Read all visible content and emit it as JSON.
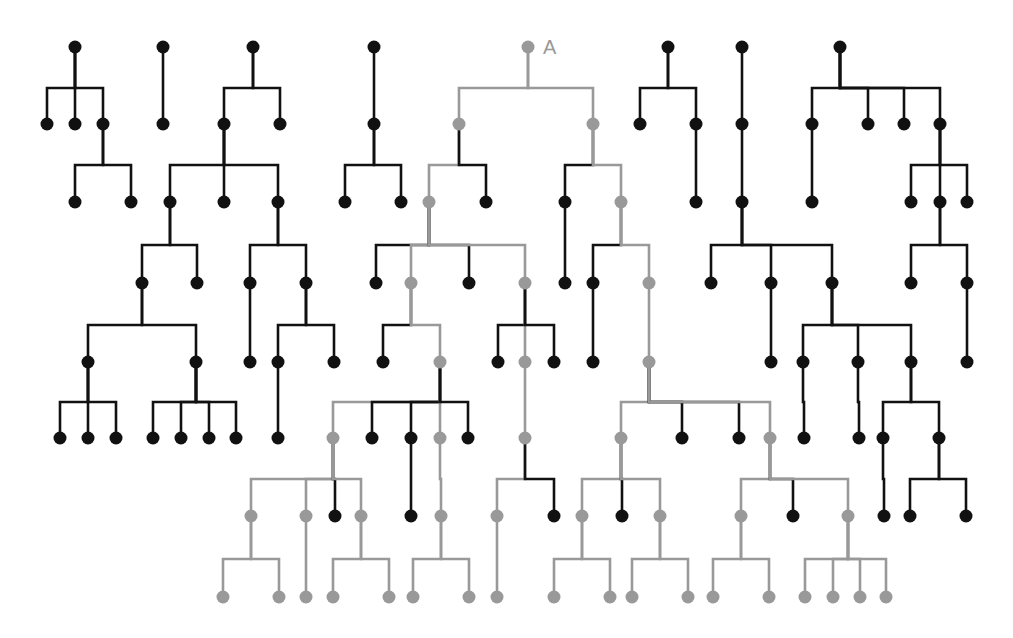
{
  "diagram": {
    "title": "",
    "label_A": "A",
    "colors": {
      "black": "#111111",
      "gray": "#999999",
      "background": "#ffffff"
    },
    "row_y": [
      47,
      124,
      202,
      283,
      362,
      438,
      516,
      597
    ],
    "nodes": [
      {
        "id": "t1",
        "x": 75,
        "y": 47,
        "c": "b"
      },
      {
        "id": "t1a",
        "x": 47,
        "y": 124,
        "c": "b"
      },
      {
        "id": "t1b",
        "x": 75,
        "y": 124,
        "c": "b"
      },
      {
        "id": "t1c",
        "x": 103,
        "y": 124,
        "c": "b"
      },
      {
        "id": "t1c1",
        "x": 75,
        "y": 202,
        "c": "b"
      },
      {
        "id": "t1c2",
        "x": 131,
        "y": 202,
        "c": "b"
      },
      {
        "id": "t2",
        "x": 163,
        "y": 47,
        "c": "b"
      },
      {
        "id": "t2a",
        "x": 163,
        "y": 124,
        "c": "b"
      },
      {
        "id": "t3",
        "x": 253,
        "y": 47,
        "c": "b"
      },
      {
        "id": "t3a",
        "x": 224,
        "y": 124,
        "c": "b"
      },
      {
        "id": "t3b",
        "x": 280,
        "y": 124,
        "c": "b"
      },
      {
        "id": "t3a1",
        "x": 170,
        "y": 202,
        "c": "b"
      },
      {
        "id": "t3a2",
        "x": 224,
        "y": 202,
        "c": "b"
      },
      {
        "id": "t3a3",
        "x": 278,
        "y": 202,
        "c": "b"
      },
      {
        "id": "t3a1a",
        "x": 142,
        "y": 283,
        "c": "b"
      },
      {
        "id": "t3a1b",
        "x": 197,
        "y": 283,
        "c": "b"
      },
      {
        "id": "t3a3a",
        "x": 250,
        "y": 283,
        "c": "b"
      },
      {
        "id": "t3a3b",
        "x": 306,
        "y": 283,
        "c": "b"
      },
      {
        "id": "t3x1",
        "x": 88,
        "y": 362,
        "c": "b"
      },
      {
        "id": "t3x2",
        "x": 196,
        "y": 362,
        "c": "b"
      },
      {
        "id": "t3a3a1",
        "x": 250,
        "y": 362,
        "c": "b"
      },
      {
        "id": "t3a3b1",
        "x": 278,
        "y": 362,
        "c": "b"
      },
      {
        "id": "t3a3b2",
        "x": 334,
        "y": 362,
        "c": "b"
      },
      {
        "id": "l1",
        "x": 60,
        "y": 438,
        "c": "b"
      },
      {
        "id": "l2",
        "x": 88,
        "y": 438,
        "c": "b"
      },
      {
        "id": "l3",
        "x": 116,
        "y": 438,
        "c": "b"
      },
      {
        "id": "l4",
        "x": 153,
        "y": 438,
        "c": "b"
      },
      {
        "id": "l5",
        "x": 181,
        "y": 438,
        "c": "b"
      },
      {
        "id": "l6",
        "x": 209,
        "y": 438,
        "c": "b"
      },
      {
        "id": "l7",
        "x": 236,
        "y": 438,
        "c": "b"
      },
      {
        "id": "l8",
        "x": 278,
        "y": 438,
        "c": "b"
      },
      {
        "id": "t4",
        "x": 374,
        "y": 47,
        "c": "b"
      },
      {
        "id": "t4a",
        "x": 374,
        "y": 124,
        "c": "b"
      },
      {
        "id": "t4a1",
        "x": 345,
        "y": 202,
        "c": "b"
      },
      {
        "id": "t4a2",
        "x": 401,
        "y": 202,
        "c": "b"
      },
      {
        "id": "A",
        "x": 528,
        "y": 47,
        "c": "g"
      },
      {
        "id": "A1",
        "x": 459,
        "y": 124,
        "c": "g"
      },
      {
        "id": "A2",
        "x": 593,
        "y": 124,
        "c": "g"
      },
      {
        "id": "A1a",
        "x": 429,
        "y": 202,
        "c": "g"
      },
      {
        "id": "A1b",
        "x": 486,
        "y": 202,
        "c": "b"
      },
      {
        "id": "A2a",
        "x": 565,
        "y": 202,
        "c": "b"
      },
      {
        "id": "A2b",
        "x": 621,
        "y": 202,
        "c": "g"
      },
      {
        "id": "A1a1",
        "x": 376,
        "y": 283,
        "c": "b"
      },
      {
        "id": "A1a2",
        "x": 411,
        "y": 283,
        "c": "g"
      },
      {
        "id": "A1a3",
        "x": 469,
        "y": 283,
        "c": "b"
      },
      {
        "id": "A1a4",
        "x": 525,
        "y": 283,
        "c": "g"
      },
      {
        "id": "A2a1",
        "x": 565,
        "y": 283,
        "c": "b"
      },
      {
        "id": "A2b1",
        "x": 593,
        "y": 283,
        "c": "b"
      },
      {
        "id": "A2b2",
        "x": 649,
        "y": 283,
        "c": "g"
      },
      {
        "id": "A1a2a",
        "x": 383,
        "y": 362,
        "c": "b"
      },
      {
        "id": "A1a2b",
        "x": 440,
        "y": 362,
        "c": "g"
      },
      {
        "id": "A1a4a",
        "x": 498,
        "y": 362,
        "c": "b"
      },
      {
        "id": "A1a4b",
        "x": 525,
        "y": 362,
        "c": "g"
      },
      {
        "id": "A1a4c",
        "x": 554,
        "y": 362,
        "c": "b"
      },
      {
        "id": "A2b1a",
        "x": 593,
        "y": 362,
        "c": "b"
      },
      {
        "id": "A2b2a",
        "x": 649,
        "y": 362,
        "c": "g"
      },
      {
        "id": "B1",
        "x": 333,
        "y": 438,
        "c": "g"
      },
      {
        "id": "B2",
        "x": 372,
        "y": 438,
        "c": "b"
      },
      {
        "id": "B3",
        "x": 411,
        "y": 438,
        "c": "b"
      },
      {
        "id": "B4",
        "x": 440,
        "y": 438,
        "c": "g"
      },
      {
        "id": "B5",
        "x": 468,
        "y": 438,
        "c": "b"
      },
      {
        "id": "B6",
        "x": 525,
        "y": 438,
        "c": "g"
      },
      {
        "id": "C1",
        "x": 621,
        "y": 438,
        "c": "g"
      },
      {
        "id": "C2",
        "x": 682,
        "y": 438,
        "c": "b"
      },
      {
        "id": "C3",
        "x": 739,
        "y": 438,
        "c": "b"
      },
      {
        "id": "C4",
        "x": 770,
        "y": 438,
        "c": "g"
      },
      {
        "id": "D1",
        "x": 251,
        "y": 516,
        "c": "g"
      },
      {
        "id": "D2",
        "x": 306,
        "y": 516,
        "c": "g"
      },
      {
        "id": "D3",
        "x": 335,
        "y": 516,
        "c": "b"
      },
      {
        "id": "D4",
        "x": 361,
        "y": 516,
        "c": "g"
      },
      {
        "id": "D5",
        "x": 411,
        "y": 516,
        "c": "b"
      },
      {
        "id": "D6",
        "x": 441,
        "y": 516,
        "c": "g"
      },
      {
        "id": "D7",
        "x": 497,
        "y": 516,
        "c": "g"
      },
      {
        "id": "D8",
        "x": 554,
        "y": 516,
        "c": "b"
      },
      {
        "id": "D9",
        "x": 582,
        "y": 516,
        "c": "g"
      },
      {
        "id": "D10",
        "x": 622,
        "y": 516,
        "c": "b"
      },
      {
        "id": "D11",
        "x": 660,
        "y": 516,
        "c": "g"
      },
      {
        "id": "D12",
        "x": 741,
        "y": 516,
        "c": "g"
      },
      {
        "id": "D13",
        "x": 793,
        "y": 516,
        "c": "b"
      },
      {
        "id": "D14",
        "x": 848,
        "y": 516,
        "c": "g"
      },
      {
        "id": "E1",
        "x": 223,
        "y": 597,
        "c": "g"
      },
      {
        "id": "E2",
        "x": 279,
        "y": 597,
        "c": "g"
      },
      {
        "id": "E3",
        "x": 306,
        "y": 597,
        "c": "g"
      },
      {
        "id": "E4",
        "x": 333,
        "y": 597,
        "c": "g"
      },
      {
        "id": "E5",
        "x": 389,
        "y": 597,
        "c": "g"
      },
      {
        "id": "E6",
        "x": 413,
        "y": 597,
        "c": "g"
      },
      {
        "id": "E7",
        "x": 469,
        "y": 597,
        "c": "g"
      },
      {
        "id": "E8",
        "x": 497,
        "y": 597,
        "c": "g"
      },
      {
        "id": "E9",
        "x": 554,
        "y": 597,
        "c": "g"
      },
      {
        "id": "E10",
        "x": 610,
        "y": 597,
        "c": "g"
      },
      {
        "id": "E11",
        "x": 632,
        "y": 597,
        "c": "g"
      },
      {
        "id": "E12",
        "x": 688,
        "y": 597,
        "c": "g"
      },
      {
        "id": "E13",
        "x": 713,
        "y": 597,
        "c": "g"
      },
      {
        "id": "E14",
        "x": 769,
        "y": 597,
        "c": "g"
      },
      {
        "id": "E15",
        "x": 805,
        "y": 597,
        "c": "g"
      },
      {
        "id": "E16",
        "x": 833,
        "y": 597,
        "c": "g"
      },
      {
        "id": "E17",
        "x": 860,
        "y": 597,
        "c": "g"
      },
      {
        "id": "E18",
        "x": 886,
        "y": 597,
        "c": "g"
      },
      {
        "id": "t5",
        "x": 668,
        "y": 47,
        "c": "b"
      },
      {
        "id": "t5a",
        "x": 640,
        "y": 124,
        "c": "b"
      },
      {
        "id": "t5b",
        "x": 696,
        "y": 124,
        "c": "b"
      },
      {
        "id": "t5b1",
        "x": 696,
        "y": 202,
        "c": "b"
      },
      {
        "id": "t6",
        "x": 742,
        "y": 47,
        "c": "b"
      },
      {
        "id": "t6a",
        "x": 742,
        "y": 124,
        "c": "b"
      },
      {
        "id": "t6b",
        "x": 742,
        "y": 202,
        "c": "b"
      },
      {
        "id": "t6c1",
        "x": 711,
        "y": 283,
        "c": "b"
      },
      {
        "id": "t6c2",
        "x": 771,
        "y": 283,
        "c": "b"
      },
      {
        "id": "t6c3",
        "x": 832,
        "y": 283,
        "c": "b"
      },
      {
        "id": "t6c2a",
        "x": 771,
        "y": 362,
        "c": "b"
      },
      {
        "id": "t6d1",
        "x": 803,
        "y": 362,
        "c": "b"
      },
      {
        "id": "t6d2",
        "x": 858,
        "y": 362,
        "c": "b"
      },
      {
        "id": "t6d3",
        "x": 911,
        "y": 362,
        "c": "b"
      },
      {
        "id": "t6d1a",
        "x": 804,
        "y": 438,
        "c": "b"
      },
      {
        "id": "t6d2a",
        "x": 859,
        "y": 438,
        "c": "b"
      },
      {
        "id": "t6e1",
        "x": 883,
        "y": 438,
        "c": "b"
      },
      {
        "id": "t6e2",
        "x": 939,
        "y": 438,
        "c": "b"
      },
      {
        "id": "t6e1a",
        "x": 884,
        "y": 516,
        "c": "b"
      },
      {
        "id": "t6f1",
        "x": 910,
        "y": 516,
        "c": "b"
      },
      {
        "id": "t6f2",
        "x": 966,
        "y": 516,
        "c": "b"
      },
      {
        "id": "t7",
        "x": 840,
        "y": 47,
        "c": "b"
      },
      {
        "id": "t7a",
        "x": 812,
        "y": 124,
        "c": "b"
      },
      {
        "id": "t7b",
        "x": 868,
        "y": 124,
        "c": "b"
      },
      {
        "id": "t7c",
        "x": 904,
        "y": 124,
        "c": "b"
      },
      {
        "id": "t7d",
        "x": 940,
        "y": 124,
        "c": "b"
      },
      {
        "id": "t7a1",
        "x": 812,
        "y": 202,
        "c": "b"
      },
      {
        "id": "t7d1",
        "x": 911,
        "y": 202,
        "c": "b"
      },
      {
        "id": "t7d2",
        "x": 940,
        "y": 202,
        "c": "b"
      },
      {
        "id": "t7d3",
        "x": 967,
        "y": 202,
        "c": "b"
      },
      {
        "id": "t7e1",
        "x": 911,
        "y": 283,
        "c": "b"
      },
      {
        "id": "t7e2",
        "x": 967,
        "y": 283,
        "c": "b"
      },
      {
        "id": "t7e2a",
        "x": 967,
        "y": 362,
        "c": "b"
      }
    ],
    "edges": [
      [
        "t1",
        "t1a",
        "b"
      ],
      [
        "t1",
        "t1b",
        "b"
      ],
      [
        "t1",
        "t1c",
        "b"
      ],
      [
        "t1c",
        "t1c1",
        "b"
      ],
      [
        "t1c",
        "t1c2",
        "b"
      ],
      [
        "t2",
        "t2a",
        "b"
      ],
      [
        "t3",
        "t3a",
        "b"
      ],
      [
        "t3",
        "t3b",
        "b"
      ],
      [
        "t3a",
        "t3a1",
        "b"
      ],
      [
        "t3a",
        "t3a2",
        "b"
      ],
      [
        "t3a",
        "t3a3",
        "b"
      ],
      [
        "t3a1",
        "t3a1a",
        "b"
      ],
      [
        "t3a1",
        "t3a1b",
        "b"
      ],
      [
        "t3a3",
        "t3a3a",
        "b"
      ],
      [
        "t3a3",
        "t3a3b",
        "b"
      ],
      [
        "t3a1a",
        "t3x1",
        "b"
      ],
      [
        "t3a1a",
        "t3x2",
        "b"
      ],
      [
        "t3a3a",
        "t3a3a1",
        "b"
      ],
      [
        "t3a3b",
        "t3a3b1",
        "b"
      ],
      [
        "t3a3b",
        "t3a3b2",
        "b"
      ],
      [
        "t3x1",
        "l1",
        "b"
      ],
      [
        "t3x1",
        "l2",
        "b"
      ],
      [
        "t3x1",
        "l3",
        "b"
      ],
      [
        "t3x2",
        "l4",
        "b"
      ],
      [
        "t3x2",
        "l5",
        "b"
      ],
      [
        "t3x2",
        "l6",
        "b"
      ],
      [
        "t3x2",
        "l7",
        "b"
      ],
      [
        "t3a3b1",
        "l8",
        "b"
      ],
      [
        "t4",
        "t4a",
        "b"
      ],
      [
        "t4a",
        "t4a1",
        "b"
      ],
      [
        "t4a",
        "t4a2",
        "b"
      ],
      [
        "A",
        "A1",
        "g"
      ],
      [
        "A",
        "A2",
        "g"
      ],
      [
        "A1",
        "A1a",
        "g"
      ],
      [
        "A1",
        "A1b",
        "b"
      ],
      [
        "A2",
        "A2a",
        "b"
      ],
      [
        "A2",
        "A2b",
        "g"
      ],
      [
        "A1a",
        "A1a1",
        "b"
      ],
      [
        "A1a",
        "A1a2",
        "g"
      ],
      [
        "A1a",
        "A1a3",
        "b"
      ],
      [
        "A1a",
        "A1a4",
        "g"
      ],
      [
        "A2a",
        "A2a1",
        "b"
      ],
      [
        "A2b",
        "A2b1",
        "b"
      ],
      [
        "A2b",
        "A2b2",
        "g"
      ],
      [
        "A1a2",
        "A1a2a",
        "b"
      ],
      [
        "A1a2",
        "A1a2b",
        "g"
      ],
      [
        "A1a4",
        "A1a4a",
        "b"
      ],
      [
        "A1a4",
        "A1a4b",
        "g"
      ],
      [
        "A1a4",
        "A1a4c",
        "b"
      ],
      [
        "A2b1",
        "A2b1a",
        "b"
      ],
      [
        "A2b2",
        "A2b2a",
        "g"
      ],
      [
        "A1a2b",
        "B1",
        "g"
      ],
      [
        "A1a2b",
        "B2",
        "b"
      ],
      [
        "A1a2b",
        "B3",
        "b"
      ],
      [
        "A1a2b",
        "B4",
        "g"
      ],
      [
        "A1a2b",
        "B5",
        "b"
      ],
      [
        "A1a4b",
        "B6",
        "g"
      ],
      [
        "A2b2a",
        "C1",
        "g"
      ],
      [
        "A2b2a",
        "C2",
        "b"
      ],
      [
        "A2b2a",
        "C3",
        "b"
      ],
      [
        "A2b2a",
        "C4",
        "g"
      ],
      [
        "B1",
        "D1",
        "g"
      ],
      [
        "B1",
        "D2",
        "g"
      ],
      [
        "B1",
        "D3",
        "b"
      ],
      [
        "B1",
        "D4",
        "g"
      ],
      [
        "B3",
        "D5",
        "b"
      ],
      [
        "B4",
        "D6",
        "g"
      ],
      [
        "B6",
        "D7",
        "g"
      ],
      [
        "B6",
        "D8",
        "b"
      ],
      [
        "C1",
        "D9",
        "g"
      ],
      [
        "C1",
        "D10",
        "b"
      ],
      [
        "C1",
        "D11",
        "g"
      ],
      [
        "C4",
        "D12",
        "g"
      ],
      [
        "C4",
        "D13",
        "b"
      ],
      [
        "C4",
        "D14",
        "g"
      ],
      [
        "D1",
        "E1",
        "g"
      ],
      [
        "D1",
        "E2",
        "g"
      ],
      [
        "D2",
        "E3",
        "g"
      ],
      [
        "D4",
        "E4",
        "g"
      ],
      [
        "D4",
        "E5",
        "g"
      ],
      [
        "D6",
        "E6",
        "g"
      ],
      [
        "D6",
        "E7",
        "g"
      ],
      [
        "D7",
        "E8",
        "g"
      ],
      [
        "D9",
        "E9",
        "g"
      ],
      [
        "D9",
        "E10",
        "g"
      ],
      [
        "D11",
        "E11",
        "g"
      ],
      [
        "D11",
        "E12",
        "g"
      ],
      [
        "D12",
        "E13",
        "g"
      ],
      [
        "D12",
        "E14",
        "g"
      ],
      [
        "D14",
        "E15",
        "g"
      ],
      [
        "D14",
        "E16",
        "g"
      ],
      [
        "D14",
        "E17",
        "g"
      ],
      [
        "D14",
        "E18",
        "g"
      ],
      [
        "t5",
        "t5a",
        "b"
      ],
      [
        "t5",
        "t5b",
        "b"
      ],
      [
        "t5b",
        "t5b1",
        "b"
      ],
      [
        "t6",
        "t6a",
        "b"
      ],
      [
        "t6a",
        "t6b",
        "b"
      ],
      [
        "t6b",
        "t6c1",
        "b"
      ],
      [
        "t6b",
        "t6c2",
        "b"
      ],
      [
        "t6b",
        "t6c3",
        "b"
      ],
      [
        "t6c2",
        "t6c2a",
        "b"
      ],
      [
        "t6c3",
        "t6d1",
        "b"
      ],
      [
        "t6c3",
        "t6d2",
        "b"
      ],
      [
        "t6c3",
        "t6d3",
        "b"
      ],
      [
        "t6d1",
        "t6d1a",
        "b"
      ],
      [
        "t6d2",
        "t6d2a",
        "b"
      ],
      [
        "t6d3",
        "t6e1",
        "b"
      ],
      [
        "t6d3",
        "t6e2",
        "b"
      ],
      [
        "t6e1",
        "t6e1a",
        "b"
      ],
      [
        "t6e2",
        "t6f1",
        "b"
      ],
      [
        "t6e2",
        "t6f2",
        "b"
      ],
      [
        "t7",
        "t7a",
        "b"
      ],
      [
        "t7",
        "t7b",
        "b"
      ],
      [
        "t7",
        "t7c",
        "b"
      ],
      [
        "t7",
        "t7d",
        "b"
      ],
      [
        "t7a",
        "t7a1",
        "b"
      ],
      [
        "t7d",
        "t7d1",
        "b"
      ],
      [
        "t7d",
        "t7d2",
        "b"
      ],
      [
        "t7d",
        "t7d3",
        "b"
      ],
      [
        "t7d2",
        "t7e1",
        "b"
      ],
      [
        "t7d2",
        "t7e2",
        "b"
      ],
      [
        "t7e2",
        "t7e2a",
        "b"
      ]
    ]
  }
}
